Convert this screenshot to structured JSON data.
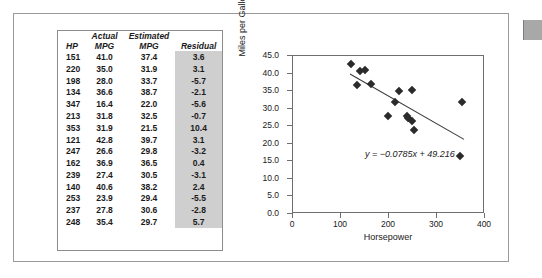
{
  "table": {
    "headers_top": [
      "",
      "Actual",
      "Estimated",
      ""
    ],
    "headers_bottom": [
      "HP",
      "MPG",
      "MPG",
      "Residual"
    ],
    "rows": [
      {
        "hp": "151",
        "actual": "41.0",
        "estimated": "37.4",
        "residual": "3.6"
      },
      {
        "hp": "220",
        "actual": "35.0",
        "estimated": "31.9",
        "residual": "3.1"
      },
      {
        "hp": "198",
        "actual": "28.0",
        "estimated": "33.7",
        "residual": "-5.7"
      },
      {
        "hp": "134",
        "actual": "36.6",
        "estimated": "38.7",
        "residual": "-2.1"
      },
      {
        "hp": "347",
        "actual": "16.4",
        "estimated": "22.0",
        "residual": "-5.6"
      },
      {
        "hp": "213",
        "actual": "31.8",
        "estimated": "32.5",
        "residual": "-0.7"
      },
      {
        "hp": "353",
        "actual": "31.9",
        "estimated": "21.5",
        "residual": "10.4"
      },
      {
        "hp": "121",
        "actual": "42.8",
        "estimated": "39.7",
        "residual": "3.1"
      },
      {
        "hp": "247",
        "actual": "26.6",
        "estimated": "29.8",
        "residual": "-3.2"
      },
      {
        "hp": "162",
        "actual": "36.9",
        "estimated": "36.5",
        "residual": "0.4"
      },
      {
        "hp": "239",
        "actual": "27.4",
        "estimated": "30.5",
        "residual": "-3.1"
      },
      {
        "hp": "140",
        "actual": "40.6",
        "estimated": "38.2",
        "residual": "2.4"
      },
      {
        "hp": "253",
        "actual": "23.9",
        "estimated": "29.4",
        "residual": "-5.5"
      },
      {
        "hp": "237",
        "actual": "27.8",
        "estimated": "30.6",
        "residual": "-2.8"
      },
      {
        "hp": "248",
        "actual": "35.4",
        "estimated": "29.7",
        "residual": "5.7"
      }
    ]
  },
  "chart_data": {
    "type": "scatter",
    "title": "",
    "xlabel": "Horsepower",
    "ylabel": "Miles per Gallon",
    "xlim": [
      0,
      400
    ],
    "ylim": [
      0,
      45
    ],
    "xticks": [
      0,
      100,
      200,
      300,
      400
    ],
    "xtick_labels": [
      "0",
      "100",
      "200",
      "300",
      "400"
    ],
    "yticks": [
      0,
      5,
      10,
      15,
      20,
      25,
      30,
      35,
      40,
      45
    ],
    "ytick_labels": [
      "0.0",
      "5.0",
      "10.0",
      "15.0",
      "20.0",
      "25.0",
      "30.0",
      "35.0",
      "40.0",
      "45.0"
    ],
    "grid": false,
    "legend": false,
    "marker": "diamond",
    "marker_color": "#2b2b2b",
    "points": [
      {
        "x": 151,
        "y": 41.0
      },
      {
        "x": 220,
        "y": 35.0
      },
      {
        "x": 198,
        "y": 28.0
      },
      {
        "x": 134,
        "y": 36.6
      },
      {
        "x": 347,
        "y": 16.4
      },
      {
        "x": 213,
        "y": 31.8
      },
      {
        "x": 353,
        "y": 31.9
      },
      {
        "x": 121,
        "y": 42.8
      },
      {
        "x": 247,
        "y": 26.6
      },
      {
        "x": 162,
        "y": 36.9
      },
      {
        "x": 239,
        "y": 27.4
      },
      {
        "x": 140,
        "y": 40.6
      },
      {
        "x": 253,
        "y": 23.9
      },
      {
        "x": 237,
        "y": 27.8
      },
      {
        "x": 248,
        "y": 35.4
      }
    ],
    "trendline": {
      "slope": -0.0785,
      "intercept": 49.216,
      "x_start": 120,
      "x_end": 360,
      "color": "#3a3a3a",
      "annotation": "y = −0.0785x + 49.216",
      "annotation_x": 150,
      "annotation_y": 18.5
    }
  }
}
